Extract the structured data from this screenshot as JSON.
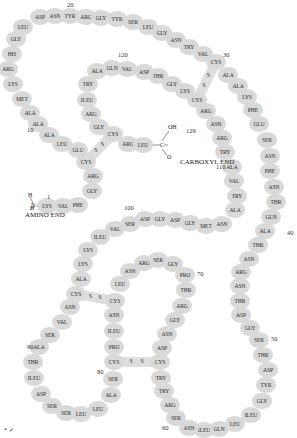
{
  "labels": {
    "amino_end": "AMINO END",
    "carboxyl_end": "CARBOXYL END",
    "h1": "H",
    "h2": "H",
    "n": "N",
    "oh": "OH",
    "c": "C",
    "o": "O",
    "disulfide_s": "S",
    "corner_mark": "* ✓"
  },
  "position_numbers": [
    {
      "text": "1",
      "x": 47,
      "y": 197
    },
    {
      "text": "10",
      "x": 27,
      "y": 130
    },
    {
      "text": "20",
      "x": 67,
      "y": 5
    },
    {
      "text": "30",
      "x": 223,
      "y": 55
    },
    {
      "text": "40",
      "x": 287,
      "y": 233
    },
    {
      "text": "50",
      "x": 271,
      "y": 339
    },
    {
      "text": "60",
      "x": 162,
      "y": 428
    },
    {
      "text": "70",
      "x": 197,
      "y": 274
    },
    {
      "text": "80",
      "x": 97,
      "y": 372
    },
    {
      "text": "90",
      "x": 27,
      "y": 347
    },
    {
      "text": "100",
      "x": 124,
      "y": 208
    },
    {
      "text": "110",
      "x": 216,
      "y": 167
    },
    {
      "text": "120",
      "x": 118,
      "y": 55
    },
    {
      "text": "129",
      "x": 186,
      "y": 131
    }
  ],
  "residues": [
    {
      "n": 1,
      "name": "LYS",
      "x": 47,
      "y": 206
    },
    {
      "n": 2,
      "name": "VAL",
      "x": 63,
      "y": 206
    },
    {
      "n": 3,
      "name": "PHE",
      "x": 78,
      "y": 205
    },
    {
      "n": 4,
      "name": "GLY",
      "x": 92,
      "y": 191
    },
    {
      "n": 5,
      "name": "ARG",
      "x": 93,
      "y": 176
    },
    {
      "n": 6,
      "name": "CYS",
      "x": 86,
      "y": 162
    },
    {
      "n": 7,
      "name": "GLU",
      "x": 78,
      "y": 150
    },
    {
      "n": 8,
      "name": "LEU",
      "x": 62,
      "y": 144
    },
    {
      "n": 9,
      "name": "ALA",
      "x": 49,
      "y": 135
    },
    {
      "n": 10,
      "name": "ALA",
      "x": 38,
      "y": 124
    },
    {
      "n": 11,
      "name": "ALA",
      "x": 30,
      "y": 113
    },
    {
      "n": 12,
      "name": "MET",
      "x": 22,
      "y": 99
    },
    {
      "n": 13,
      "name": "LYS",
      "x": 13,
      "y": 84
    },
    {
      "n": 14,
      "name": "ARG",
      "x": 8,
      "y": 69
    },
    {
      "n": 15,
      "name": "HIS",
      "x": 12,
      "y": 54
    },
    {
      "n": 16,
      "name": "GLY",
      "x": 16,
      "y": 39
    },
    {
      "n": 17,
      "name": "LEU",
      "x": 23,
      "y": 27
    },
    {
      "n": 18,
      "name": "ASP",
      "x": 40,
      "y": 17
    },
    {
      "n": 19,
      "name": "ASN",
      "x": 55,
      "y": 16
    },
    {
      "n": 20,
      "name": "TYR",
      "x": 70,
      "y": 16
    },
    {
      "n": 21,
      "name": "ARG",
      "x": 86,
      "y": 17
    },
    {
      "n": 22,
      "name": "GLY",
      "x": 101,
      "y": 18
    },
    {
      "n": 23,
      "name": "TYR",
      "x": 117,
      "y": 19
    },
    {
      "n": 24,
      "name": "SER",
      "x": 133,
      "y": 22
    },
    {
      "n": 25,
      "name": "LEU",
      "x": 148,
      "y": 27
    },
    {
      "n": 26,
      "name": "GLY",
      "x": 162,
      "y": 33
    },
    {
      "n": 27,
      "name": "ASN",
      "x": 176,
      "y": 40
    },
    {
      "n": 28,
      "name": "TRY",
      "x": 189,
      "y": 47
    },
    {
      "n": 29,
      "name": "VAL",
      "x": 203,
      "y": 54
    },
    {
      "n": 30,
      "name": "CYS",
      "x": 216,
      "y": 62
    },
    {
      "n": 31,
      "name": "ALA",
      "x": 228,
      "y": 75
    },
    {
      "n": 32,
      "name": "ALA",
      "x": 238,
      "y": 86
    },
    {
      "n": 33,
      "name": "LYS",
      "x": 247,
      "y": 97
    },
    {
      "n": 34,
      "name": "PHE",
      "x": 253,
      "y": 110
    },
    {
      "n": 35,
      "name": "GLU",
      "x": 259,
      "y": 124
    },
    {
      "n": 36,
      "name": "SER",
      "x": 267,
      "y": 140
    },
    {
      "n": 37,
      "name": "ASN",
      "x": 270,
      "y": 156
    },
    {
      "n": 38,
      "name": "PHE",
      "x": 270,
      "y": 171
    },
    {
      "n": 39,
      "name": "ASN",
      "x": 274,
      "y": 187
    },
    {
      "n": 40,
      "name": "THR",
      "x": 276,
      "y": 202
    },
    {
      "n": 41,
      "name": "GLN",
      "x": 271,
      "y": 217
    },
    {
      "n": 42,
      "name": "ALA",
      "x": 265,
      "y": 231
    },
    {
      "n": 43,
      "name": "THR",
      "x": 258,
      "y": 245
    },
    {
      "n": 44,
      "name": "ASN",
      "x": 249,
      "y": 259
    },
    {
      "n": 45,
      "name": "ARG",
      "x": 241,
      "y": 272
    },
    {
      "n": 46,
      "name": "ASN",
      "x": 240,
      "y": 286
    },
    {
      "n": 47,
      "name": "THR",
      "x": 240,
      "y": 301
    },
    {
      "n": 48,
      "name": "ASP",
      "x": 241,
      "y": 315
    },
    {
      "n": 49,
      "name": "GLY",
      "x": 250,
      "y": 328
    },
    {
      "n": 50,
      "name": "SER",
      "x": 259,
      "y": 340
    },
    {
      "n": 51,
      "name": "THR",
      "x": 263,
      "y": 355
    },
    {
      "n": 52,
      "name": "ASP",
      "x": 268,
      "y": 370
    },
    {
      "n": 53,
      "name": "TYR",
      "x": 266,
      "y": 385
    },
    {
      "n": 54,
      "name": "GLY",
      "x": 262,
      "y": 401
    },
    {
      "n": 55,
      "name": "ILEU",
      "x": 251,
      "y": 415
    },
    {
      "n": 56,
      "name": "LEU",
      "x": 235,
      "y": 424
    },
    {
      "n": 57,
      "name": "GLN",
      "x": 219,
      "y": 429
    },
    {
      "n": 58,
      "name": "ILEU",
      "x": 204,
      "y": 430
    },
    {
      "n": 59,
      "name": "ASN",
      "x": 189,
      "y": 428
    },
    {
      "n": 60,
      "name": "SER",
      "x": 176,
      "y": 418
    },
    {
      "n": 61,
      "name": "ARG",
      "x": 170,
      "y": 405
    },
    {
      "n": 62,
      "name": "TRY",
      "x": 164,
      "y": 391
    },
    {
      "n": 63,
      "name": "TRY",
      "x": 161,
      "y": 378
    },
    {
      "n": 64,
      "name": "CYS",
      "x": 160,
      "y": 362
    },
    {
      "n": 65,
      "name": "ASP",
      "x": 162,
      "y": 348
    },
    {
      "n": 66,
      "name": "ASN",
      "x": 167,
      "y": 334
    },
    {
      "n": 67,
      "name": "GLY",
      "x": 175,
      "y": 320
    },
    {
      "n": 68,
      "name": "ARG",
      "x": 182,
      "y": 306
    },
    {
      "n": 69,
      "name": "THR",
      "x": 186,
      "y": 290
    },
    {
      "n": 70,
      "name": "PRO",
      "x": 185,
      "y": 275
    },
    {
      "n": 71,
      "name": "GLY",
      "x": 173,
      "y": 264
    },
    {
      "n": 72,
      "name": "SER",
      "x": 158,
      "y": 260
    },
    {
      "n": 73,
      "name": "ARG",
      "x": 144,
      "y": 263
    },
    {
      "n": 74,
      "name": "ASN",
      "x": 130,
      "y": 271
    },
    {
      "n": 75,
      "name": "LEU",
      "x": 120,
      "y": 284
    },
    {
      "n": 76,
      "name": "CYS",
      "x": 115,
      "y": 301
    },
    {
      "n": 77,
      "name": "ASN",
      "x": 114,
      "y": 315
    },
    {
      "n": 78,
      "name": "ILEU",
      "x": 114,
      "y": 331
    },
    {
      "n": 79,
      "name": "PRO",
      "x": 114,
      "y": 347
    },
    {
      "n": 80,
      "name": "CYS",
      "x": 114,
      "y": 362
    },
    {
      "n": 81,
      "name": "SER",
      "x": 113,
      "y": 379
    },
    {
      "n": 82,
      "name": "ALA",
      "x": 111,
      "y": 395
    },
    {
      "n": 83,
      "name": "LEU",
      "x": 98,
      "y": 409
    },
    {
      "n": 84,
      "name": "LEU",
      "x": 81,
      "y": 414
    },
    {
      "n": 85,
      "name": "SER",
      "x": 66,
      "y": 413
    },
    {
      "n": 86,
      "name": "SER",
      "x": 52,
      "y": 406
    },
    {
      "n": 87,
      "name": "ASP",
      "x": 41,
      "y": 394
    },
    {
      "n": 88,
      "name": "ILEU",
      "x": 34,
      "y": 378
    },
    {
      "n": 89,
      "name": "THR",
      "x": 33,
      "y": 362
    },
    {
      "n": 90,
      "name": "ALA",
      "x": 39,
      "y": 347
    },
    {
      "n": 91,
      "name": "SER",
      "x": 50,
      "y": 335
    },
    {
      "n": 92,
      "name": "VAL",
      "x": 62,
      "y": 322
    },
    {
      "n": 93,
      "name": "ASN",
      "x": 70,
      "y": 307
    },
    {
      "n": 94,
      "name": "CYS",
      "x": 76,
      "y": 294
    },
    {
      "n": 95,
      "name": "ALA",
      "x": 81,
      "y": 279
    },
    {
      "n": 96,
      "name": "LYS",
      "x": 83,
      "y": 264
    },
    {
      "n": 97,
      "name": "LYS",
      "x": 88,
      "y": 250
    },
    {
      "n": 98,
      "name": "ILEU",
      "x": 100,
      "y": 237
    },
    {
      "n": 99,
      "name": "VAL",
      "x": 115,
      "y": 229
    },
    {
      "n": 100,
      "name": "SER",
      "x": 130,
      "y": 224
    },
    {
      "n": 101,
      "name": "ASP",
      "x": 145,
      "y": 219
    },
    {
      "n": 102,
      "name": "GLY",
      "x": 160,
      "y": 219
    },
    {
      "n": 103,
      "name": "ASP",
      "x": 175,
      "y": 220
    },
    {
      "n": 104,
      "name": "GLY",
      "x": 190,
      "y": 223
    },
    {
      "n": 105,
      "name": "MET",
      "x": 206,
      "y": 226
    },
    {
      "n": 106,
      "name": "ASN",
      "x": 222,
      "y": 224
    },
    {
      "n": 107,
      "name": "ALA",
      "x": 235,
      "y": 210
    },
    {
      "n": 108,
      "name": "TRY",
      "x": 237,
      "y": 196
    },
    {
      "n": 109,
      "name": "VAL",
      "x": 234,
      "y": 181
    },
    {
      "n": 110,
      "name": "ALA",
      "x": 232,
      "y": 167
    },
    {
      "n": 111,
      "name": "TRY",
      "x": 225,
      "y": 152
    },
    {
      "n": 112,
      "name": "ARG",
      "x": 222,
      "y": 138
    },
    {
      "n": 113,
      "name": "ASN",
      "x": 216,
      "y": 124
    },
    {
      "n": 114,
      "name": "ARG",
      "x": 206,
      "y": 111
    },
    {
      "n": 115,
      "name": "CYS",
      "x": 197,
      "y": 100
    },
    {
      "n": 116,
      "name": "LYS",
      "x": 185,
      "y": 91
    },
    {
      "n": 117,
      "name": "GLY",
      "x": 172,
      "y": 84
    },
    {
      "n": 118,
      "name": "THR",
      "x": 158,
      "y": 76
    },
    {
      "n": 119,
      "name": "ASP",
      "x": 144,
      "y": 72
    },
    {
      "n": 120,
      "name": "VAL",
      "x": 127,
      "y": 69
    },
    {
      "n": 121,
      "name": "GLN",
      "x": 112,
      "y": 68
    },
    {
      "n": 122,
      "name": "ALA",
      "x": 97,
      "y": 71
    },
    {
      "n": 123,
      "name": "TRY",
      "x": 88,
      "y": 84
    },
    {
      "n": 124,
      "name": "ILEU",
      "x": 87,
      "y": 100
    },
    {
      "n": 125,
      "name": "ARG",
      "x": 91,
      "y": 114
    },
    {
      "n": 126,
      "name": "GLY",
      "x": 99,
      "y": 127
    },
    {
      "n": 127,
      "name": "CYS",
      "x": 113,
      "y": 134
    },
    {
      "n": 128,
      "name": "ARG",
      "x": 128,
      "y": 144
    },
    {
      "n": 129,
      "name": "LEU",
      "x": 143,
      "y": 145
    }
  ],
  "disulfide_bonds": [
    {
      "from": 6,
      "to": 127
    },
    {
      "from": 30,
      "to": 115
    },
    {
      "from": 64,
      "to": 80
    },
    {
      "from": 76,
      "to": 94
    }
  ]
}
